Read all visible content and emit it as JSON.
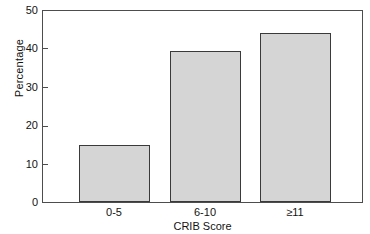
{
  "chart_data": {
    "type": "bar",
    "title": "",
    "xlabel": "CRIB Score",
    "ylabel": "Percentage",
    "categories": [
      "0-5",
      "6-10",
      "≥11"
    ],
    "values": [
      15.0,
      39.5,
      44.3
    ],
    "ylim": [
      0,
      50
    ],
    "yticks": [
      0,
      10,
      20,
      30,
      40,
      50
    ],
    "ytick_labels": [
      "0",
      "10",
      "20",
      "30",
      "40",
      "50"
    ],
    "grid": false,
    "legend": null,
    "series": [
      {
        "name": "Percentage",
        "values": [
          15.0,
          39.5,
          44.3
        ]
      }
    ],
    "bar_fill_color": "#d5d5d5",
    "bar_edge_color": "#3a3a3a",
    "axis_color": "#4d4d4d",
    "background_color": "#ffffff"
  }
}
